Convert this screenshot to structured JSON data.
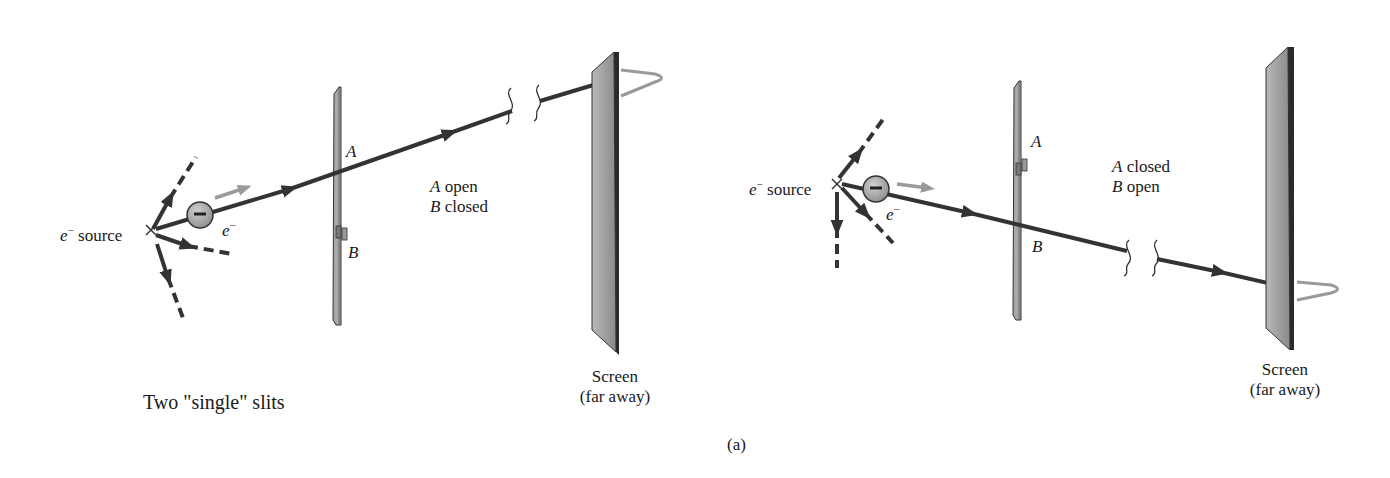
{
  "figure": {
    "label": "(a)",
    "title": "Two \"single\" slits"
  },
  "colors": {
    "beam": "#333333",
    "plate_fill": "#a8a8a8",
    "screen_fill": "#9a9a9a",
    "screen_edge": "#2a2a2a",
    "electron_fill": "#a0a0a0",
    "motion_arrow": "#9a9a9a",
    "intensity_curve": "#9a9a9a"
  },
  "panels": [
    {
      "name": "left",
      "source_label": {
        "symbol": "e",
        "sup": "−",
        "text": "source"
      },
      "electron_label": {
        "symbol": "e",
        "sup": "−"
      },
      "electron_sign": "−",
      "slit_a_label": "A",
      "slit_b_label": "B",
      "state": {
        "line1_letter": "A",
        "line1_text": "open",
        "line2_letter": "B",
        "line2_text": "closed"
      },
      "screen_label": {
        "line1": "Screen",
        "line2": "(far away)"
      }
    },
    {
      "name": "right",
      "source_label": {
        "symbol": "e",
        "sup": "−",
        "text": "source"
      },
      "electron_label": {
        "symbol": "e",
        "sup": "−"
      },
      "electron_sign": "−",
      "slit_a_label": "A",
      "slit_b_label": "B",
      "state": {
        "line1_letter": "A",
        "line1_text": "closed",
        "line2_letter": "B",
        "line2_text": "open"
      },
      "screen_label": {
        "line1": "Screen",
        "line2": "(far away)"
      }
    }
  ]
}
